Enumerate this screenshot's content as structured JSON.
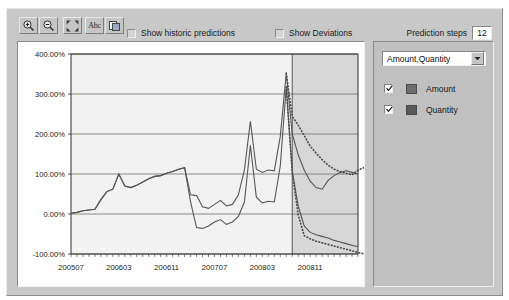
{
  "toolbar": {
    "buttons": [
      {
        "name": "zoom-in-icon",
        "title": "Zoom In"
      },
      {
        "name": "zoom-out-icon",
        "title": "Zoom Out"
      },
      {
        "name": "fit-to-window-icon",
        "title": "Fit"
      },
      {
        "name": "abc-labels-icon",
        "title": "Abc",
        "label": "Abc"
      },
      {
        "name": "copy-chart-icon",
        "title": "Copy"
      }
    ],
    "show_historic_predictions_label": "Show historic predictions",
    "show_historic_predictions_checked": false,
    "show_deviations_label": "Show Deviations",
    "show_deviations_checked": false,
    "prediction_steps_label": "Prediction steps",
    "prediction_steps_value": "12"
  },
  "side_panel": {
    "series_selector_value": "Amount,Quantity",
    "series_selector_options": [
      "Amount,Quantity",
      "Amount",
      "Quantity"
    ],
    "legend": [
      {
        "label": "Amount",
        "checked": true,
        "color": "#6e6e6e"
      },
      {
        "label": "Quantity",
        "checked": true,
        "color": "#5a5a5a"
      }
    ]
  },
  "chart_data": {
    "type": "line",
    "title": "",
    "xlabel": "",
    "ylabel": "",
    "grid": true,
    "legend_position": "right-panel",
    "ylim": [
      -100,
      400
    ],
    "ytick_values": [
      400,
      300,
      200,
      100,
      0,
      -100
    ],
    "ytick_labels": [
      "400.00%",
      "300.00%",
      "200.00%",
      "100.00%",
      "0.00%",
      "-100.00%"
    ],
    "xtick_labels": [
      "200507",
      "200603",
      "200611",
      "200707",
      "200803",
      "200811"
    ],
    "xtick_positions": [
      0,
      8,
      16,
      24,
      32,
      40
    ],
    "x_index_count": 49,
    "forecast_start_index": 37,
    "forecast_shading_color": "#d7d7d7",
    "plot_background": "#f2f2f2",
    "series": [
      {
        "name": "Amount",
        "color": "#555555",
        "style": "solid",
        "values": [
          2,
          4,
          8,
          10,
          12,
          36,
          56,
          62,
          100,
          70,
          66,
          72,
          80,
          88,
          94,
          96,
          102,
          106,
          112,
          116,
          48,
          46,
          18,
          14,
          24,
          34,
          20,
          24,
          48,
          110,
          232,
          112,
          104,
          110,
          108,
          194,
          352,
          200,
          148,
          110,
          82,
          66,
          62,
          84,
          96,
          104,
          108,
          104,
          100
        ]
      },
      {
        "name": "Quantity",
        "color": "#555555",
        "style": "solid",
        "values": [
          2,
          4,
          8,
          10,
          12,
          36,
          56,
          62,
          100,
          70,
          66,
          72,
          80,
          88,
          94,
          96,
          102,
          106,
          112,
          116,
          30,
          -34,
          -36,
          -30,
          -20,
          -14,
          -26,
          -20,
          -6,
          30,
          172,
          42,
          28,
          32,
          30,
          120,
          318,
          108,
          20,
          -30,
          -46,
          -52,
          -56,
          -60,
          -66,
          -70,
          -74,
          -78,
          -82
        ]
      },
      {
        "name": "Amount forecast",
        "color": "#4d4d4d",
        "style": "dotted",
        "from_index": 36,
        "values": [
          352,
          244,
          222,
          196,
          170,
          152,
          136,
          122,
          112,
          106,
          102,
          98,
          110,
          116,
          118,
          114
        ]
      },
      {
        "name": "Quantity forecast",
        "color": "#4d4d4d",
        "style": "dotted",
        "from_index": 36,
        "values": [
          318,
          104,
          -2,
          -54,
          -62,
          -68,
          -72,
          -76,
          -80,
          -84,
          -88,
          -92,
          -96,
          -100,
          -104,
          -108
        ]
      }
    ]
  }
}
